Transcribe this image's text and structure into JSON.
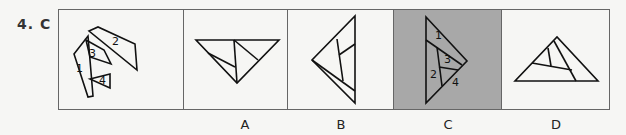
{
  "question": {
    "number": "4.",
    "answer": "C"
  },
  "options": [
    {
      "label": "A"
    },
    {
      "label": "B"
    },
    {
      "label": "C",
      "highlighted": true,
      "highlight_color": "#a8a8a8"
    },
    {
      "label": "D"
    }
  ],
  "pieces": {
    "p1": "1",
    "p2": "2",
    "p3": "3",
    "p4": "4"
  },
  "answer_numbers": {
    "n1": "1",
    "n2": "2",
    "n3": "3",
    "n4": "4"
  }
}
